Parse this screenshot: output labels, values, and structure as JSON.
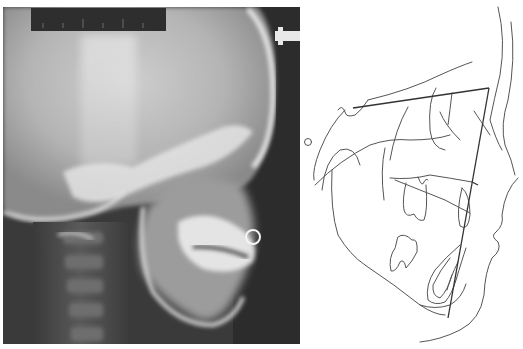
{
  "figure": {
    "panels": [
      {
        "id": "left",
        "label": "lateral-cephalometric-radiograph",
        "ruler_text": "",
        "colors": {
          "background_dark": "#2a2a2a",
          "bone": "#e6e6e6",
          "soft_tissue": "#8a8a8a",
          "ruler": "#2e2e2e"
        }
      },
      {
        "id": "right",
        "label": "cephalometric-tracing",
        "colors": {
          "line": "#555555",
          "reference_line": "#333333",
          "background": "#ffffff"
        }
      }
    ]
  }
}
